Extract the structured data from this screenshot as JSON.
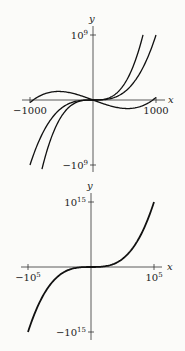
{
  "chart_data": [
    {
      "type": "line",
      "title": "",
      "xlabel": "x",
      "ylabel": "y",
      "xlim": [
        -1000,
        1000
      ],
      "ylim": [
        -1000000000,
        1000000000
      ],
      "x_ticks": [
        {
          "value": -1000,
          "label": "−1000"
        },
        {
          "value": 1000,
          "label": "1000"
        }
      ],
      "y_ticks": [
        {
          "value": 1000000000,
          "base": "10",
          "exp": "9",
          "sign": ""
        },
        {
          "value": -1000000000,
          "base": "10",
          "exp": "9",
          "sign": "−"
        }
      ],
      "grid": false,
      "series": [
        {
          "name": "steep cubic",
          "formula": "2x^3",
          "x": [
            -810,
            -600,
            -400,
            -200,
            0,
            200,
            400,
            600,
            794
          ],
          "y": [
            -1060000000.0,
            -432000000.0,
            -128000000.0,
            -16000000.0,
            0,
            16000000.0,
            128000000.0,
            432000000.0,
            1000000000.0
          ]
        },
        {
          "name": "cubic",
          "formula": "x^3",
          "x": [
            -1000,
            -800,
            -600,
            -400,
            -200,
            0,
            200,
            400,
            600,
            800,
            1000
          ],
          "y": [
            -1000000000.0,
            -512000000.0,
            -216000000.0,
            -64000000.0,
            -8000000.0,
            0,
            8000000.0,
            64000000.0,
            216000000.0,
            512000000.0,
            1000000000.0
          ]
        },
        {
          "name": "wavy cubic",
          "formula": "0.4(x^3 - 9e5 x)",
          "x": [
            -1000,
            -800,
            -577,
            -300,
            0,
            300,
            577,
            800,
            1000
          ],
          "y": [
            -40000000.0,
            83000000.0,
            131000000.0,
            97000000.0,
            0,
            -97000000.0,
            -131000000.0,
            -83000000.0,
            40000000.0
          ]
        }
      ]
    },
    {
      "type": "line",
      "title": "",
      "xlabel": "x",
      "ylabel": "y",
      "xlim": [
        -100000,
        100000
      ],
      "ylim": [
        -1000000000000000.0,
        1000000000000000.0
      ],
      "x_ticks": [
        {
          "value": -100000,
          "base": "10",
          "exp": "5",
          "sign": "−"
        },
        {
          "value": 100000,
          "base": "10",
          "exp": "5",
          "sign": ""
        }
      ],
      "y_ticks": [
        {
          "value": 1000000000000000.0,
          "base": "10",
          "exp": "15",
          "sign": ""
        },
        {
          "value": -1000000000000000.0,
          "base": "10",
          "exp": "15",
          "sign": "−"
        }
      ],
      "grid": false,
      "series": [
        {
          "name": "cubic",
          "formula": "x^3",
          "x": [
            -100000,
            -50000,
            0,
            50000,
            100000
          ],
          "y": [
            -1000000000000000.0,
            -125000000000000.0,
            0,
            125000000000000.0,
            1000000000000000.0
          ]
        }
      ]
    }
  ]
}
